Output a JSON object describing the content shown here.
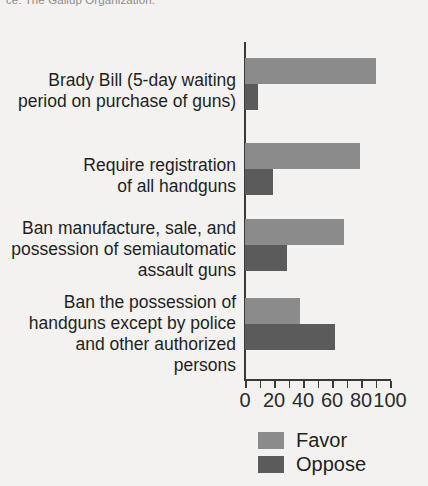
{
  "source_note": "ce: The Gallup Organization.",
  "legend": {
    "position": "bottom-left-of-axis",
    "entries": [
      {
        "label": "Favor",
        "color": "#8b8b8b",
        "swatch_name": "legend-swatch-favor"
      },
      {
        "label": "Oppose",
        "color": "#5b5b5b",
        "swatch_name": "legend-swatch-oppose"
      }
    ]
  },
  "chart_data": {
    "type": "bar",
    "orientation": "horizontal",
    "title": "",
    "subtitle": "",
    "xlabel": "",
    "ylabel": "",
    "xlim": [
      0,
      100
    ],
    "xticks": [
      0,
      10,
      20,
      30,
      40,
      50,
      60,
      70,
      80,
      90,
      100
    ],
    "xtick_labels": [
      "0",
      "",
      "20",
      "",
      "40",
      "",
      "60",
      "",
      "80",
      "",
      "100"
    ],
    "grid": false,
    "legend_position": "bottom",
    "categories": [
      "Brady Bill (5-day waiting\nperiod on purchase of guns)",
      "Require registration\nof all handguns",
      "Ban manufacture, sale, and\npossession of semiautomatic\nassault guns",
      "Ban the possession of\nhandguns except by police\nand other authorized persons"
    ],
    "series": [
      {
        "name": "Favor",
        "color": "#8b8b8b",
        "values": [
          90,
          79,
          68,
          38
        ]
      },
      {
        "name": "Oppose",
        "color": "#5b5b5b",
        "values": [
          9,
          19,
          29,
          62
        ]
      }
    ]
  }
}
